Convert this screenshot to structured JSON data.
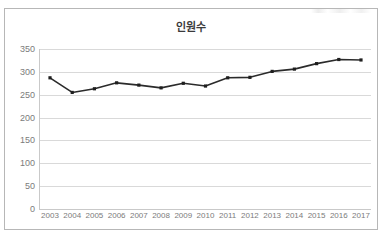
{
  "chart_data": {
    "type": "line",
    "title": "인원수",
    "xlabel": "",
    "ylabel": "",
    "categories": [
      "2003",
      "2004",
      "2005",
      "2006",
      "2007",
      "2008",
      "2009",
      "2010",
      "2011",
      "2012",
      "2013",
      "2014",
      "2015",
      "2016",
      "2017"
    ],
    "values": [
      287,
      255,
      263,
      276,
      271,
      265,
      275,
      269,
      287,
      288,
      301,
      306,
      318,
      327,
      326
    ],
    "series": [
      {
        "name": "인원수",
        "values": [
          287,
          255,
          263,
          276,
          271,
          265,
          275,
          269,
          287,
          288,
          301,
          306,
          318,
          327,
          326
        ]
      }
    ],
    "ylim": [
      0,
      350
    ],
    "yticks": [
      0,
      50,
      100,
      150,
      200,
      250,
      300,
      350
    ],
    "ytick_labels": [
      "0",
      "50",
      "100",
      "150",
      "200",
      "250",
      "300",
      "350"
    ],
    "grid": true,
    "legend": false,
    "legend_position": "none",
    "line_color": "#2b2b2b",
    "marker": "square",
    "marker_color": "#1f1f1f",
    "grid_color": "#d9d9d9",
    "title_color": "#3a3a3a",
    "tick_label_color": "#7b7b7b",
    "plot_background": "#ffffff",
    "border_color": "#b7b7b7"
  }
}
